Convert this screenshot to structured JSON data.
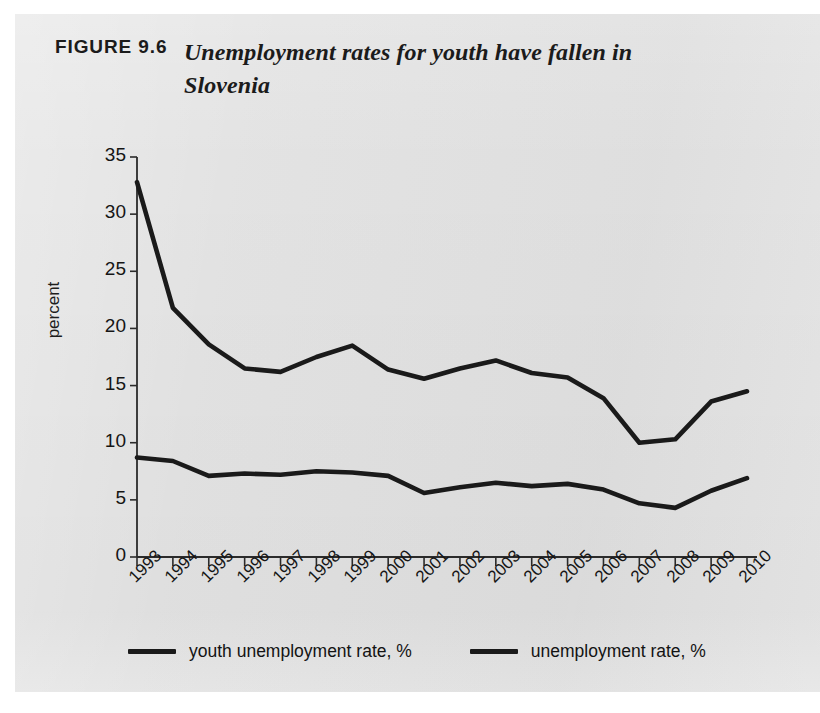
{
  "figure": {
    "label": "FIGURE 9.6",
    "title": "Unemployment rates for youth have fallen in Slovenia"
  },
  "axes": {
    "ylabel": "percent",
    "yticks": [
      "0",
      "5",
      "10",
      "15",
      "20",
      "25",
      "30",
      "35"
    ],
    "xticks": [
      "1993",
      "1994",
      "1995",
      "1996",
      "1997",
      "1998",
      "1999",
      "2000",
      "2001",
      "2002",
      "2003",
      "2004",
      "2005",
      "2006",
      "2007",
      "2008",
      "2009",
      "2010"
    ]
  },
  "legend": {
    "items": [
      {
        "label": "youth unemployment rate, %",
        "color": "#1a1a1a"
      },
      {
        "label": "unemployment rate, %",
        "color": "#1a1a1a"
      }
    ]
  },
  "chart_data": {
    "type": "line",
    "title": "Unemployment rates for youth have fallen in Slovenia",
    "xlabel": "",
    "ylabel": "percent",
    "ylim": [
      0,
      35
    ],
    "ytick_step": 5,
    "grid": false,
    "legend_position": "bottom",
    "x": [
      1993,
      1994,
      1995,
      1996,
      1997,
      1998,
      1999,
      2000,
      2001,
      2002,
      2003,
      2004,
      2005,
      2006,
      2007,
      2008,
      2009,
      2010
    ],
    "series": [
      {
        "name": "youth unemployment rate, %",
        "color": "#1a1a1a",
        "values": [
          32.8,
          21.8,
          18.6,
          16.5,
          16.2,
          17.5,
          18.5,
          16.4,
          15.6,
          16.5,
          17.2,
          16.1,
          15.7,
          13.9,
          10.0,
          10.3,
          13.6,
          14.5
        ]
      },
      {
        "name": "unemployment rate, %",
        "color": "#1a1a1a",
        "values": [
          8.7,
          8.4,
          7.1,
          7.3,
          7.2,
          7.5,
          7.4,
          7.1,
          5.6,
          6.1,
          6.5,
          6.2,
          6.4,
          5.9,
          4.7,
          4.3,
          5.8,
          6.9
        ]
      }
    ]
  }
}
